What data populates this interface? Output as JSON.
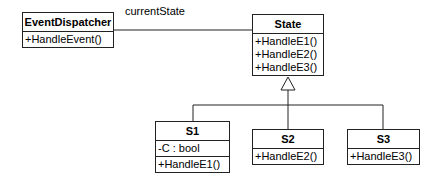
{
  "diagram": {
    "type": "uml-class-diagram",
    "association_label": "currentState",
    "classes": {
      "event_dispatcher": {
        "name": "EventDispatcher",
        "attributes": [],
        "operations": [
          "+HandleEvent()"
        ]
      },
      "state": {
        "name": "State",
        "attributes": [],
        "operations": [
          "+HandleE1()",
          "+HandleE2()",
          "+HandleE3()"
        ]
      },
      "s1": {
        "name": "S1",
        "attributes": [
          "-C : bool"
        ],
        "operations": [
          "+HandleE1()"
        ]
      },
      "s2": {
        "name": "S2",
        "attributes": [],
        "operations": [
          "+HandleE2()"
        ]
      },
      "s3": {
        "name": "S3",
        "attributes": [],
        "operations": [
          "+HandleE3()"
        ]
      }
    },
    "relationships": [
      {
        "type": "association",
        "from": "EventDispatcher",
        "to": "State",
        "label": "currentState"
      },
      {
        "type": "generalization",
        "from": "S1",
        "to": "State"
      },
      {
        "type": "generalization",
        "from": "S2",
        "to": "State"
      },
      {
        "type": "generalization",
        "from": "S3",
        "to": "State"
      }
    ],
    "colors": {
      "line": "#222222",
      "background": "#ffffff"
    }
  }
}
